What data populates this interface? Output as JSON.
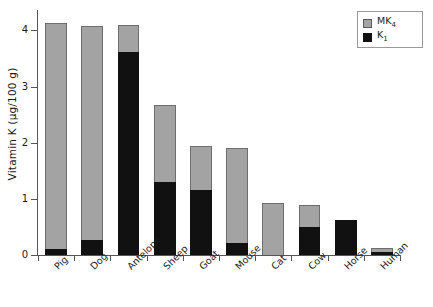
{
  "chart_data": {
    "type": "bar",
    "stacked": true,
    "title": "",
    "xlabel": "",
    "ylabel": "Vitamin K (µg/100 g)",
    "ylim": [
      0,
      4.4
    ],
    "yticks": [
      0,
      1,
      2,
      3,
      4
    ],
    "ytick_labels": [
      "0",
      "1",
      "2",
      "3",
      "4"
    ],
    "grid": false,
    "legend_position": "top-right",
    "categories": [
      "Pig",
      "Dog",
      "Antelope",
      "Sheep",
      "Goat",
      "Mouse",
      "Cat",
      "Cow",
      "Horse",
      "Human"
    ],
    "series": [
      {
        "name": "K1",
        "label": "K",
        "sub": "1",
        "color": "#111111",
        "values": [
          0.1,
          0.26,
          3.62,
          1.3,
          1.15,
          0.22,
          0.0,
          0.5,
          0.63,
          0.05
        ]
      },
      {
        "name": "MK4",
        "label": "MK",
        "sub": "4",
        "color": "#a3a3a3",
        "values": [
          4.03,
          3.82,
          0.48,
          1.37,
          0.8,
          1.69,
          0.93,
          0.39,
          0.0,
          0.07
        ]
      }
    ],
    "totals": [
      4.13,
      4.08,
      4.1,
      2.67,
      1.95,
      1.91,
      0.93,
      0.89,
      0.63,
      0.12
    ]
  },
  "legend": {
    "items": [
      {
        "label": "MK",
        "sub": "4",
        "swatch": "mk4"
      },
      {
        "label": "K",
        "sub": "1",
        "swatch": "k1"
      }
    ]
  },
  "axes": {
    "y_title": "Vitamin K (µg/100 g)"
  }
}
